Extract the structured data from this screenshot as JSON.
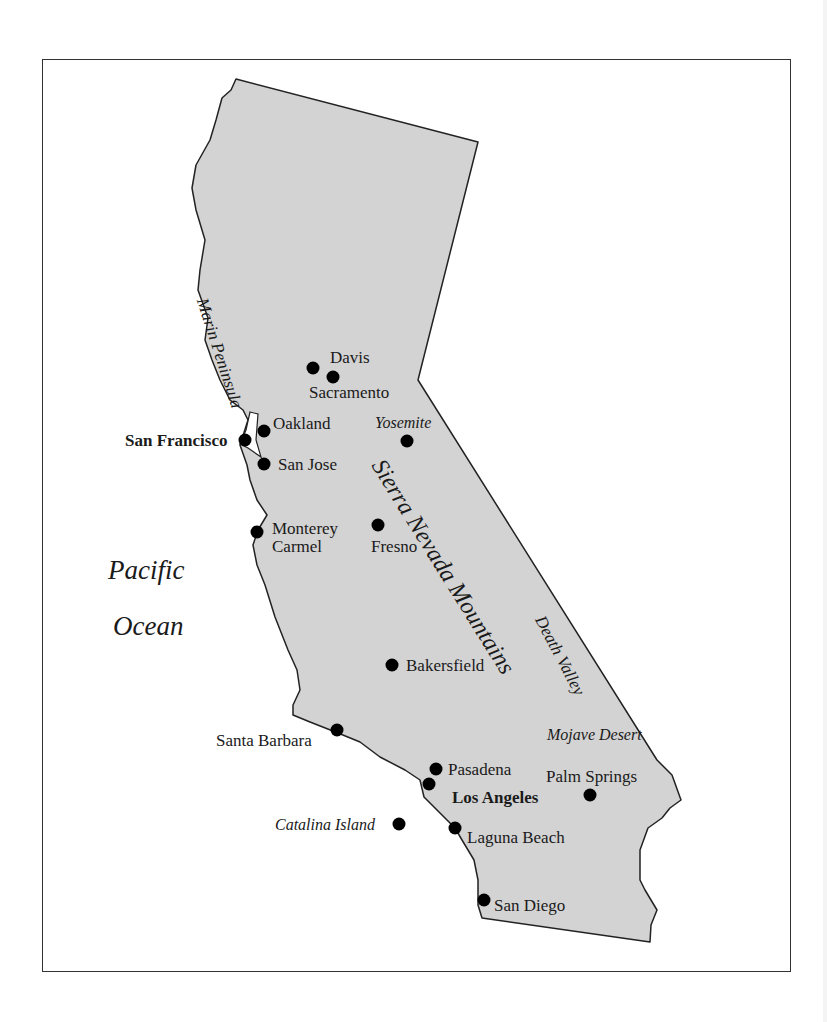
{
  "map": {
    "title": "California",
    "fill_color": "#d3d3d3",
    "outline_color": "#222222",
    "ocean": {
      "line1": "Pacific",
      "line2": "Ocean"
    },
    "regions": {
      "marin": "Marin Peninsula",
      "sierra": "Sierra Nevada Mountains",
      "death_valley": "Death Valley",
      "mojave": "Mojave Desert",
      "yosemite": "Yosemite",
      "catalina": "Catalina Island"
    },
    "cities": {
      "davis": "Davis",
      "sacramento": "Sacramento",
      "oakland": "Oakland",
      "san_francisco": "San Francisco",
      "san_jose": "San Jose",
      "monterey": "Monterey",
      "carmel": "Carmel",
      "fresno": "Fresno",
      "bakersfield": "Bakersfield",
      "santa_barbara": "Santa Barbara",
      "pasadena": "Pasadena",
      "los_angeles": "Los Angeles",
      "palm_springs": "Palm Springs",
      "laguna_beach": "Laguna Beach",
      "san_diego": "San Diego"
    }
  }
}
